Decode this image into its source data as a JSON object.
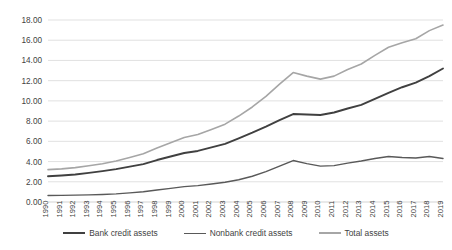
{
  "chart_data": {
    "type": "line",
    "title": "",
    "subtitle": "",
    "xlabel": "",
    "ylabel": "",
    "grid": true,
    "legend_position": "bottom",
    "ylim": [
      0,
      18
    ],
    "yticks": [
      "0.00",
      "2.00",
      "4.00",
      "6.00",
      "8.00",
      "10.00",
      "12.00",
      "14.00",
      "16.00",
      "18.00"
    ],
    "ytick_values": [
      0,
      2,
      4,
      6,
      8,
      10,
      12,
      14,
      16,
      18
    ],
    "categories": [
      "1990",
      "1991",
      "1992",
      "1993",
      "1994",
      "1995",
      "1996",
      "1997",
      "1998",
      "1999",
      "2000",
      "2001",
      "2002",
      "2003",
      "2004",
      "2005",
      "2006",
      "2007",
      "2008",
      "2009",
      "2010",
      "2011",
      "2012",
      "2013",
      "2014",
      "2015",
      "2016",
      "2017",
      "2018",
      "2019"
    ],
    "series": [
      {
        "name": "Bank credit assets",
        "color": "#404040",
        "width": 1.9,
        "values": [
          2.55,
          2.62,
          2.72,
          2.88,
          3.05,
          3.25,
          3.5,
          3.75,
          4.15,
          4.5,
          4.85,
          5.05,
          5.4,
          5.75,
          6.3,
          6.85,
          7.45,
          8.1,
          8.7,
          8.65,
          8.6,
          8.85,
          9.25,
          9.6,
          10.2,
          10.8,
          11.35,
          11.8,
          12.45,
          13.2
        ]
      },
      {
        "name": "Nonbank credit assets",
        "color": "#595959",
        "width": 1.4,
        "values": [
          0.65,
          0.66,
          0.68,
          0.7,
          0.74,
          0.8,
          0.9,
          1.02,
          1.18,
          1.35,
          1.52,
          1.62,
          1.78,
          1.95,
          2.2,
          2.55,
          3.0,
          3.55,
          4.1,
          3.8,
          3.55,
          3.6,
          3.85,
          4.05,
          4.3,
          4.5,
          4.4,
          4.35,
          4.5,
          4.3
        ]
      },
      {
        "name": "Total assets",
        "color": "#a6a6a6",
        "width": 1.6,
        "values": [
          3.2,
          3.28,
          3.4,
          3.58,
          3.79,
          4.05,
          4.4,
          4.77,
          5.33,
          5.85,
          6.37,
          6.67,
          7.18,
          7.7,
          8.5,
          9.4,
          10.45,
          11.65,
          12.8,
          12.45,
          12.15,
          12.45,
          13.1,
          13.65,
          14.5,
          15.3,
          15.75,
          16.15,
          16.95,
          17.5
        ]
      }
    ],
    "annotations": []
  },
  "legend": {
    "items": [
      {
        "label": "Bank credit assets"
      },
      {
        "label": "Nonbank credit assets"
      },
      {
        "label": "Total assets"
      }
    ]
  }
}
